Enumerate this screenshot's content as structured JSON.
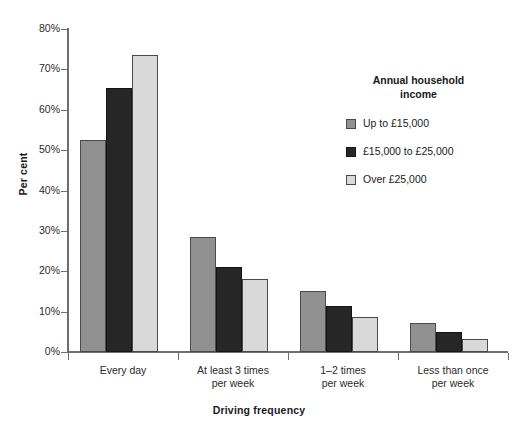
{
  "chart_data": {
    "type": "bar",
    "title": "",
    "xlabel": "Driving frequency",
    "ylabel": "Per cent",
    "ylim": [
      0,
      80
    ],
    "ytick_labels": [
      "0%",
      "10%",
      "20%",
      "30%",
      "40%",
      "50%",
      "60%",
      "70%",
      "80%"
    ],
    "ytick_values": [
      0,
      10,
      20,
      30,
      40,
      50,
      60,
      70,
      80
    ],
    "grid": false,
    "legend_position": "right",
    "legend_title": "Annual household income",
    "categories": [
      "Every day",
      "At least 3 times\nper week",
      "1–2 times\nper week",
      "Less than once\nper week"
    ],
    "category_lines": [
      [
        "Every day"
      ],
      [
        "At least 3 times",
        "per week"
      ],
      [
        "1–2 times",
        "per week"
      ],
      [
        "Less than once",
        "per week"
      ]
    ],
    "series": [
      {
        "name": "Up to £15,000",
        "color": "#919191",
        "values": [
          52.5,
          28.5,
          15.0,
          7.2
        ]
      },
      {
        "name": "£15,000 to £25,000",
        "color": "#262626",
        "values": [
          65.5,
          21.0,
          11.3,
          5.0
        ]
      },
      {
        "name": "Over £25,000",
        "color": "#d9d9d9",
        "values": [
          73.5,
          18.0,
          8.7,
          3.2
        ]
      }
    ]
  },
  "legend": {
    "title_line1": "Annual household",
    "title_line2": "income",
    "items": [
      {
        "label": "Up to £15,000"
      },
      {
        "label": "£15,000 to £25,000"
      },
      {
        "label": "Over £25,000"
      }
    ]
  },
  "axes": {
    "y_title": "Per cent",
    "x_title": "Driving frequency"
  }
}
